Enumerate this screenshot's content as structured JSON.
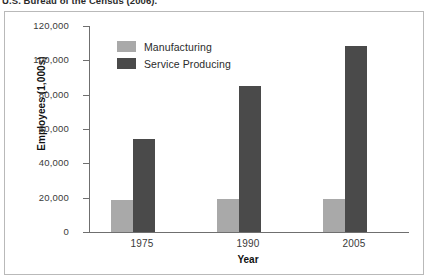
{
  "caption": {
    "text": "U.S. Bureau of the Census (2006)."
  },
  "chart_data": {
    "type": "bar",
    "title": "",
    "xlabel": "Year",
    "ylabel": "Employees (1,000s)",
    "categories": [
      "1975",
      "1990",
      "2005"
    ],
    "series": [
      {
        "name": "Manufacturing",
        "color": "#a9a9a9",
        "values": [
          18500,
          19500,
          19000
        ]
      },
      {
        "name": "Service Producing",
        "color": "#4a4a4a",
        "values": [
          54000,
          85000,
          108500
        ]
      }
    ],
    "ylim": [
      0,
      120000
    ],
    "ytick_values": [
      0,
      20000,
      40000,
      60000,
      80000,
      100000,
      120000
    ],
    "ytick_labels": [
      "0",
      "20,000",
      "40,000",
      "60,000",
      "80,000",
      "100,000",
      "120,000"
    ],
    "grid": false,
    "legend_position": "top-left"
  }
}
